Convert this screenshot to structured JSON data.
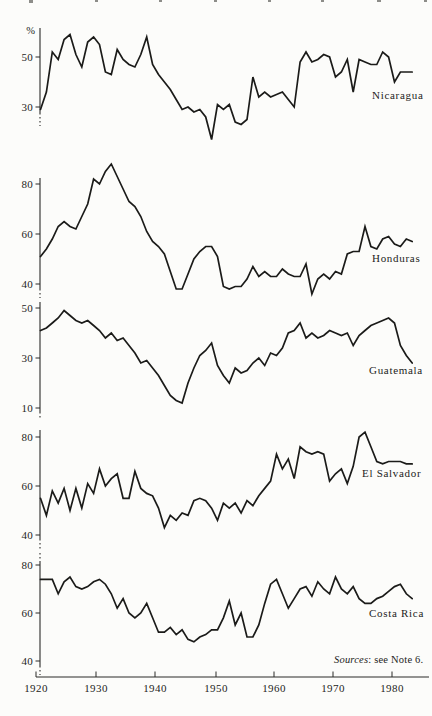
{
  "figure": {
    "sources_word": "Sources",
    "sources_rest": ": see Note 6."
  },
  "chart_data": {
    "type": "line",
    "ylabel": "%",
    "grid": false,
    "legend_position": "inside-right-of-each-panel",
    "x_range": [
      1920,
      1983
    ],
    "x_label_ticks": [
      1920,
      1930,
      1940,
      1950,
      1960,
      1970,
      1980
    ],
    "x": [
      1920,
      1921,
      1922,
      1923,
      1924,
      1925,
      1926,
      1927,
      1928,
      1929,
      1930,
      1931,
      1932,
      1933,
      1934,
      1935,
      1936,
      1937,
      1938,
      1939,
      1940,
      1941,
      1942,
      1943,
      1944,
      1945,
      1946,
      1947,
      1948,
      1949,
      1950,
      1951,
      1952,
      1953,
      1954,
      1955,
      1956,
      1957,
      1958,
      1959,
      1960,
      1961,
      1962,
      1963,
      1964,
      1965,
      1966,
      1967,
      1968,
      1969,
      1970,
      1971,
      1972,
      1973,
      1974,
      1975,
      1976,
      1977,
      1978,
      1979,
      1980,
      1981,
      1982,
      1983
    ],
    "panels": [
      {
        "name": "Nicaragua",
        "y_ticks": [
          50,
          30
        ],
        "values": [
          29,
          36,
          52,
          49,
          57,
          59,
          51,
          46,
          56,
          58,
          55,
          44,
          43,
          53,
          49,
          47,
          46,
          51,
          58,
          47,
          43,
          40,
          37,
          33,
          29,
          30,
          28,
          29,
          26,
          17,
          31,
          29,
          31,
          24,
          23,
          25,
          42,
          34,
          36,
          34,
          35,
          36,
          33,
          30,
          48,
          52,
          48,
          49,
          51,
          50,
          42,
          44,
          49,
          36,
          49,
          48,
          47,
          47,
          52,
          50,
          40,
          44,
          44,
          44
        ]
      },
      {
        "name": "Honduras",
        "y_ticks": [
          80,
          60,
          40
        ],
        "values": [
          51,
          54,
          58,
          63,
          65,
          63,
          62,
          67,
          72,
          82,
          80,
          85,
          88,
          83,
          78,
          73,
          71,
          67,
          61,
          57,
          55,
          52,
          45,
          38,
          38,
          44,
          50,
          53,
          55,
          55,
          51,
          39,
          38,
          39,
          39,
          42,
          47,
          43,
          45,
          43,
          43,
          46,
          44,
          43,
          43,
          48,
          36,
          42,
          44,
          42,
          45,
          44,
          52,
          53,
          53,
          63,
          55,
          54,
          58,
          59,
          56,
          55,
          58,
          57
        ]
      },
      {
        "name": "Guatemala",
        "y_ticks": [
          50,
          30,
          10
        ],
        "values": [
          41,
          42,
          44,
          46,
          49,
          47,
          45,
          44,
          45,
          43,
          41,
          38,
          40,
          37,
          38,
          35,
          32,
          28,
          29,
          26,
          23,
          19,
          15,
          13,
          12,
          20,
          26,
          31,
          33,
          36,
          27,
          23,
          20,
          26,
          24,
          25,
          28,
          30,
          27,
          32,
          31,
          34,
          40,
          41,
          44,
          38,
          40,
          38,
          39,
          41,
          40,
          39,
          40,
          35,
          39,
          41,
          43,
          44,
          45,
          46,
          44,
          35,
          31,
          28
        ]
      },
      {
        "name": "El Salvador",
        "y_ticks": [
          80,
          60,
          40
        ],
        "values": [
          55,
          48,
          58,
          53,
          59,
          50,
          59,
          51,
          61,
          57,
          67,
          60,
          63,
          65,
          55,
          55,
          66,
          59,
          57,
          56,
          51,
          43,
          48,
          46,
          49,
          48,
          54,
          55,
          54,
          51,
          46,
          53,
          51,
          53,
          49,
          54,
          52,
          56,
          59,
          62,
          73,
          67,
          71,
          63,
          76,
          74,
          73,
          74,
          73,
          62,
          65,
          67,
          61,
          68,
          80,
          82,
          76,
          70,
          69,
          70,
          70,
          70,
          69,
          69
        ]
      },
      {
        "name": "Costa Rica",
        "y_ticks": [
          80,
          60,
          40
        ],
        "values": [
          74,
          74,
          74,
          68,
          73,
          75,
          71,
          70,
          71,
          73,
          74,
          72,
          68,
          62,
          66,
          60,
          58,
          60,
          64,
          58,
          52,
          52,
          54,
          51,
          53,
          49,
          48,
          50,
          51,
          53,
          53,
          58,
          65,
          55,
          60,
          50,
          50,
          55,
          64,
          72,
          74,
          68,
          62,
          66,
          70,
          71,
          67,
          73,
          70,
          68,
          75,
          70,
          68,
          71,
          66,
          64,
          64,
          66,
          67,
          69,
          71,
          72,
          68,
          66
        ]
      }
    ]
  }
}
